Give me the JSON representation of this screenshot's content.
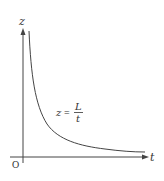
{
  "diagram": {
    "axes": {
      "x_label": "t",
      "y_label": "z",
      "origin_label": "O"
    },
    "curve": {
      "type": "hyperbola",
      "equation": "z = L / t",
      "color": "#444444"
    },
    "formula": {
      "lhs": "z",
      "equals": "=",
      "numerator": "L",
      "denominator": "t"
    },
    "colors": {
      "axis": "#444444",
      "text": "#333333",
      "background": "#ffffff"
    }
  }
}
